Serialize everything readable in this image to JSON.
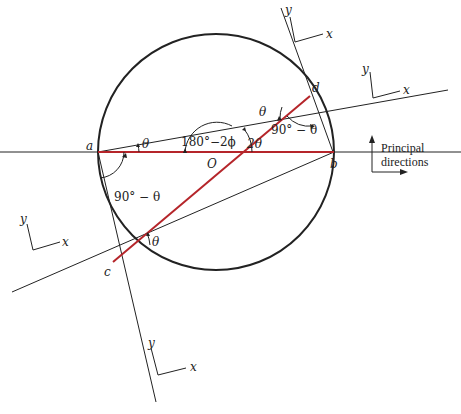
{
  "figure": {
    "colors": {
      "line": "#222222",
      "red_line": "#b5252a",
      "background": "#ffffff"
    },
    "points": {
      "a": "a",
      "b": "b",
      "c": "c",
      "d": "d",
      "O": "O"
    },
    "angles": {
      "theta_a": "θ",
      "theta_c": "θ",
      "theta_d": "θ",
      "ninety_minus_theta_left": "90° − θ",
      "ninety_minus_theta_right": "90° − θ",
      "one_eighty_minus_two_phi": "180°−2ϕ",
      "two_theta": "2θ"
    },
    "axes": {
      "top": {
        "x": "x",
        "y": "y"
      },
      "right": {
        "x": "x",
        "y": "y"
      },
      "left": {
        "x": "x",
        "y": "y"
      },
      "bottom": {
        "x": "x",
        "y": "y"
      }
    },
    "legend": {
      "line1": "Principal",
      "line2": "directions"
    }
  }
}
